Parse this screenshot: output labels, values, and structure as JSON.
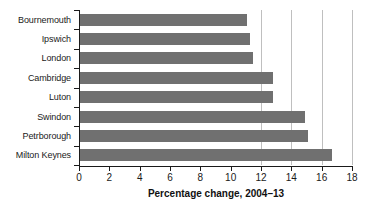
{
  "chart_data": {
    "type": "bar",
    "orientation": "horizontal",
    "title": "",
    "subtitle": "",
    "xlabel": "Percentage change, 2004–13",
    "ylabel": "",
    "categories": [
      "Bournemouth",
      "Ipswich",
      "London",
      "Cambridge",
      "Luton",
      "Swindon",
      "Petrborough",
      "Milton Keynes"
    ],
    "values": [
      11.1,
      11.3,
      11.5,
      12.8,
      12.8,
      14.9,
      15.1,
      16.7
    ],
    "xlim": [
      0,
      18
    ],
    "xticks": [
      0,
      2,
      4,
      6,
      8,
      10,
      12,
      14,
      16,
      18
    ],
    "xtick_labels": [
      "0",
      "2",
      "4",
      "6",
      "8",
      "10",
      "12",
      "14",
      "16",
      "18"
    ],
    "gridlines_x": [
      12,
      14,
      16,
      18
    ],
    "grid": true,
    "legend": false,
    "bar_color": "#707070",
    "grid_color": "#bfbfbf",
    "axis_color": "#1a1a1a"
  }
}
